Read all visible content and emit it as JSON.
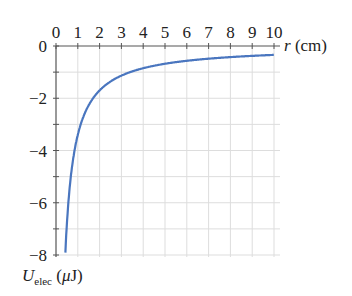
{
  "chart_data": {
    "type": "line",
    "title": "",
    "xlabel": "r (cm)",
    "ylabel": "U_elec (μJ)",
    "ylabel_main": "U",
    "ylabel_sub": "elec",
    "ylabel_unit": "(μJ)",
    "xlim": [
      0,
      10
    ],
    "ylim": [
      -8,
      0
    ],
    "xticks": [
      "0",
      "1",
      "2",
      "3",
      "4",
      "5",
      "6",
      "7",
      "8",
      "9",
      "10"
    ],
    "yticks": [
      "0",
      "−2",
      "−4",
      "−6",
      "−8"
    ],
    "grid": true,
    "line_color": "#4a76bf",
    "series": [
      {
        "name": "U_elec",
        "x": [
          0.43,
          0.5,
          0.6,
          0.7,
          0.8,
          1.0,
          1.2,
          1.5,
          2.0,
          2.5,
          3.0,
          4.0,
          5.0,
          6.0,
          7.0,
          8.0,
          9.0,
          10.0
        ],
        "y": [
          -7.9,
          -6.8,
          -5.67,
          -4.86,
          -4.25,
          -3.4,
          -2.83,
          -2.27,
          -1.7,
          -1.36,
          -1.13,
          -0.85,
          -0.68,
          -0.57,
          -0.49,
          -0.43,
          -0.38,
          -0.34
        ]
      }
    ]
  }
}
